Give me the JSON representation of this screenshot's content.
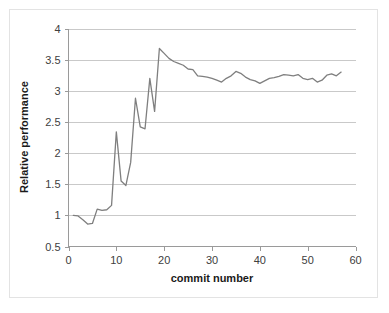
{
  "chart_data": {
    "type": "line",
    "title": "",
    "xlabel": "commit number",
    "ylabel": "Relative performance",
    "xlim": [
      0,
      60
    ],
    "ylim": [
      0.5,
      4
    ],
    "grid": true,
    "legend": null,
    "line_color": "#7f7f7f",
    "x_ticks": [
      0,
      10,
      20,
      30,
      40,
      50,
      60
    ],
    "y_ticks": [
      0.5,
      1,
      1.5,
      2,
      2.5,
      3,
      3.5,
      4
    ],
    "x_tick_labels": [
      "0",
      "10",
      "20",
      "30",
      "40",
      "50",
      "60"
    ],
    "y_tick_labels": [
      "0.5",
      "1",
      "1.5",
      "2",
      "2.5",
      "3",
      "3.5",
      "4"
    ],
    "series": [
      {
        "name": "relative performance",
        "x": [
          1,
          2,
          3,
          4,
          5,
          6,
          7,
          8,
          9,
          10,
          11,
          12,
          13,
          14,
          15,
          16,
          17,
          18,
          19,
          20,
          21,
          22,
          23,
          24,
          25,
          26,
          27,
          28,
          29,
          30,
          31,
          32,
          33,
          34,
          35,
          36,
          37,
          38,
          39,
          40,
          41,
          42,
          43,
          44,
          45,
          46,
          47,
          48,
          49,
          50,
          51,
          52,
          53,
          54,
          55,
          56,
          57
        ],
        "values": [
          1.0,
          0.99,
          0.93,
          0.86,
          0.87,
          1.1,
          1.08,
          1.09,
          1.16,
          2.34,
          1.55,
          1.48,
          1.85,
          2.88,
          2.42,
          2.39,
          3.2,
          2.67,
          3.68,
          3.6,
          3.52,
          3.47,
          3.44,
          3.41,
          3.35,
          3.34,
          3.24,
          3.23,
          3.22,
          3.2,
          3.17,
          3.14,
          3.2,
          3.24,
          3.31,
          3.28,
          3.22,
          3.18,
          3.16,
          3.12,
          3.16,
          3.2,
          3.21,
          3.23,
          3.26,
          3.25,
          3.24,
          3.26,
          3.2,
          3.18,
          3.2,
          3.14,
          3.17,
          3.25,
          3.27,
          3.24,
          3.3
        ]
      }
    ]
  }
}
